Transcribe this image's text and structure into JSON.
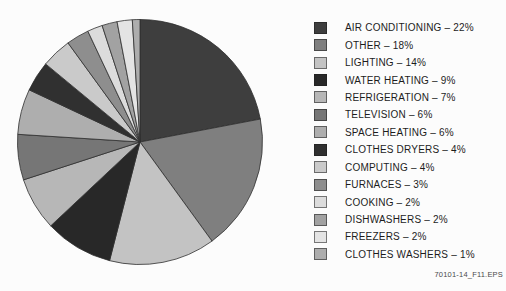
{
  "figure": {
    "file_label": "70101-14_F11.EPS"
  },
  "chart_data": {
    "type": "pie",
    "title": "",
    "start_angle_deg": 0,
    "direction": "clockwise",
    "legend_position": "right",
    "legend_separator": " – ",
    "value_suffix": "%",
    "outline_color": "#2f2f2f",
    "background_color": "#fcfcfc",
    "items": [
      {
        "label": "AIR CONDITIONING",
        "value": 22,
        "color": "#3e3e3e"
      },
      {
        "label": "OTHER",
        "value": 18,
        "color": "#7f7f7f"
      },
      {
        "label": "LIGHTING",
        "value": 14,
        "color": "#c3c3c3"
      },
      {
        "label": "WATER HEATING",
        "value": 9,
        "color": "#282828"
      },
      {
        "label": "REFRIGERATION",
        "value": 7,
        "color": "#b7b7b7"
      },
      {
        "label": "TELEVISION",
        "value": 6,
        "color": "#767676"
      },
      {
        "label": "SPACE HEATING",
        "value": 6,
        "color": "#aeaeae"
      },
      {
        "label": "CLOTHES DRYERS",
        "value": 4,
        "color": "#303030"
      },
      {
        "label": "COMPUTING",
        "value": 4,
        "color": "#cacaca"
      },
      {
        "label": "FURNACES",
        "value": 3,
        "color": "#8e8e8e"
      },
      {
        "label": "COOKING",
        "value": 2,
        "color": "#dcdcdc"
      },
      {
        "label": "DISHWASHERS",
        "value": 2,
        "color": "#a2a2a2"
      },
      {
        "label": "FREEZERS",
        "value": 2,
        "color": "#e4e4e4"
      },
      {
        "label": "CLOTHES WASHERS",
        "value": 1,
        "color": "#adadad"
      }
    ]
  }
}
